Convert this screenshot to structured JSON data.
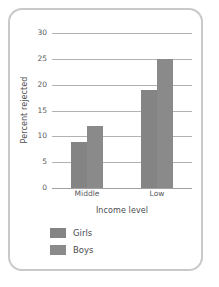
{
  "chart_data": {
    "type": "bar",
    "title": "",
    "xlabel": "Income level",
    "ylabel": "Percent rejected",
    "categories": [
      "Middle",
      "Low"
    ],
    "series": [
      {
        "name": "Girls",
        "values": [
          9,
          19
        ],
        "color": "#848484"
      },
      {
        "name": "Boys",
        "values": [
          12,
          25
        ],
        "color": "#8a8a8a"
      }
    ],
    "ylim": [
      0,
      30
    ],
    "yticks": [
      0,
      5,
      10,
      15,
      20,
      25,
      30
    ],
    "ytick_labels": [
      "0",
      "5",
      "10",
      "15",
      "20",
      "25",
      "30"
    ],
    "grid": true,
    "grid_color": "#b2b2b2",
    "legend_position": "bottom-left",
    "frame_color": "#c9c9c9",
    "background": "#ffffff"
  },
  "legend": {
    "entries": [
      {
        "label": "Girls"
      },
      {
        "label": "Boys"
      }
    ]
  }
}
